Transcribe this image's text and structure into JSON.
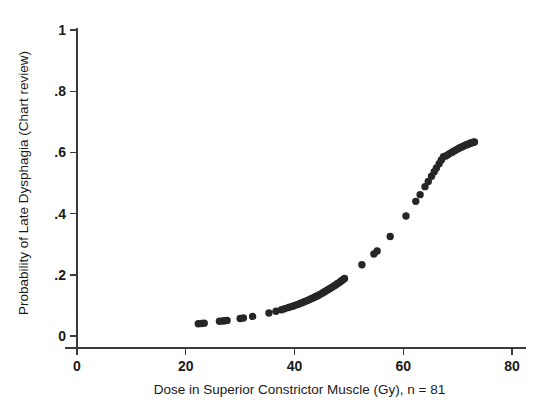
{
  "figure": {
    "background": "#ffffff",
    "point_color": "#262626",
    "axis_color": "#3a3a3a"
  },
  "chart_data": {
    "type": "scatter",
    "title": "",
    "subtitle": "",
    "xlabel": "Dose in Superior Constrictor Muscle (Gy), n = 81",
    "ylabel": "Probability of Late Dysphagia (Chart review)",
    "xlim": [
      0,
      80
    ],
    "ylim": [
      0,
      1
    ],
    "xticks": [
      0,
      20,
      40,
      60,
      80
    ],
    "xtick_labels": [
      "0",
      "20",
      "40",
      "60",
      "80"
    ],
    "yticks": [
      0,
      0.2,
      0.4,
      0.6,
      0.8,
      1
    ],
    "ytick_labels": [
      "0",
      ".2",
      ".4",
      ".6",
      ".8",
      "1"
    ],
    "grid": false,
    "legend": null,
    "n": 81,
    "marker": "filled-circle",
    "marker_size": 5,
    "series": [
      {
        "name": "Predicted probability of late dysphagia",
        "x": [
          22.3,
          22.9,
          23.4,
          26.2,
          26.8,
          27.2,
          27.6,
          30.0,
          30.6,
          32.3,
          35.3,
          36.6,
          37.6,
          38.2,
          38.9,
          39.4,
          39.8,
          40.2,
          40.6,
          41.0,
          41.4,
          41.8,
          42.1,
          42.5,
          42.9,
          43.2,
          43.6,
          43.9,
          44.2,
          44.5,
          44.8,
          45.1,
          45.4,
          45.7,
          46.0,
          46.3,
          46.6,
          46.9,
          47.2,
          47.5,
          47.8,
          48.0,
          48.3,
          48.6,
          48.9,
          49.2,
          52.4,
          54.6,
          55.2,
          57.6,
          60.5,
          62.3,
          63.1,
          64.0,
          64.6,
          65.2,
          65.7,
          66.1,
          66.6,
          67.0,
          67.4,
          67.8,
          68.2,
          68.5,
          68.9,
          69.2,
          69.6,
          69.9,
          70.2,
          70.5,
          70.8,
          71.1,
          71.4,
          71.6,
          71.9,
          72.1,
          72.3,
          72.5,
          72.7,
          72.9,
          73.1
        ],
        "y": [
          0.04,
          0.041,
          0.042,
          0.048,
          0.049,
          0.05,
          0.051,
          0.057,
          0.059,
          0.064,
          0.075,
          0.081,
          0.086,
          0.089,
          0.093,
          0.096,
          0.098,
          0.101,
          0.103,
          0.106,
          0.109,
          0.112,
          0.114,
          0.117,
          0.12,
          0.123,
          0.126,
          0.129,
          0.131,
          0.134,
          0.137,
          0.14,
          0.143,
          0.146,
          0.15,
          0.153,
          0.156,
          0.159,
          0.163,
          0.166,
          0.17,
          0.172,
          0.176,
          0.18,
          0.184,
          0.188,
          0.233,
          0.268,
          0.278,
          0.325,
          0.392,
          0.44,
          0.462,
          0.488,
          0.505,
          0.522,
          0.537,
          0.549,
          0.563,
          0.575,
          0.586,
          0.588,
          0.592,
          0.596,
          0.6,
          0.603,
          0.607,
          0.61,
          0.613,
          0.616,
          0.618,
          0.621,
          0.623,
          0.625,
          0.627,
          0.628,
          0.63,
          0.631,
          0.632,
          0.633,
          0.634
        ]
      }
    ]
  }
}
